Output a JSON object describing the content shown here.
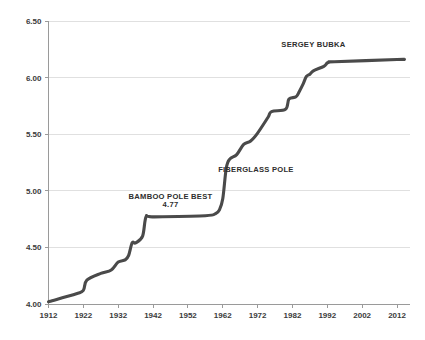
{
  "chart_data": {
    "type": "line",
    "title": "",
    "subtitle": "",
    "xlabel": "",
    "ylabel": "",
    "xlim": [
      1912,
      2014
    ],
    "ylim": [
      4.0,
      6.5
    ],
    "grid": true,
    "legend": false,
    "legend_position": "none",
    "line_color": "#4a4a4a",
    "grid_color": "#d8d8d8",
    "axis_color": "#9a9a9a",
    "background_color": "#ffffff",
    "y_ticks": [
      "6.50",
      "6.00",
      "5.50",
      "5.00",
      "4.50",
      "4.00"
    ],
    "y_tick_values": [
      6.5,
      6.0,
      5.5,
      5.0,
      4.5,
      4.0
    ],
    "x_ticks": [
      "1912",
      "1922",
      "1932",
      "1942",
      "1952",
      "1962",
      "1972",
      "1982",
      "1992",
      "2002",
      "2012"
    ],
    "x_tick_values": [
      1912,
      1922,
      1932,
      1942,
      1952,
      1962,
      1972,
      1982,
      1992,
      2002,
      2012
    ],
    "series": [
      {
        "name": "Pole vault world record",
        "x": [
          1912,
          1920,
          1922,
          1923,
          1927,
          1930,
          1932,
          1934,
          1935,
          1936,
          1937,
          1939,
          1940,
          1942,
          1957,
          1960,
          1961,
          1962,
          1963,
          1964,
          1966,
          1968,
          1970,
          1972,
          1975,
          1976,
          1980,
          1981,
          1983,
          1984,
          1985,
          1986,
          1987,
          1988,
          1991,
          1992,
          1993,
          1994,
          2012,
          2014
        ],
        "y": [
          4.02,
          4.09,
          4.12,
          4.21,
          4.27,
          4.3,
          4.37,
          4.39,
          4.43,
          4.54,
          4.54,
          4.6,
          4.77,
          4.77,
          4.78,
          4.8,
          4.83,
          4.93,
          5.2,
          5.28,
          5.32,
          5.41,
          5.44,
          5.51,
          5.65,
          5.7,
          5.72,
          5.81,
          5.83,
          5.88,
          5.94,
          6.01,
          6.03,
          6.06,
          6.1,
          6.13,
          6.14,
          6.14,
          6.16,
          6.16
        ]
      }
    ],
    "annotations": [
      {
        "id": "bamboo-annotation",
        "text": "BAMBOO POLE BEST",
        "x": 1947,
        "y": 4.93
      },
      {
        "id": "bamboo-value",
        "text": "4.77",
        "x": 1947,
        "y": 4.855
      },
      {
        "id": "fiberglass-annotation",
        "text": "FIBERGLASS POLE",
        "x": 1971.5,
        "y": 5.17
      },
      {
        "id": "bubka-annotation",
        "text": "SERGEY BUBKA",
        "x": 1988,
        "y": 6.27
      }
    ]
  }
}
